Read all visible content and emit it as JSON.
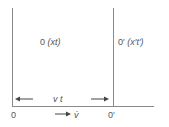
{
  "diagram": {
    "frame_S_label": "0 (xt)",
    "frame_S_origin": "0",
    "frame_S_coords": "(xt)",
    "frame_S_prime_origin": "0′",
    "frame_S_prime_coords": "(x′t′)",
    "distance_label": "v t",
    "velocity_label": "v̇",
    "origin_label": "0",
    "origin_prime_label": "0′",
    "colors": {
      "line": "#8a8a8a",
      "text": "#555555",
      "arrow": "#444444"
    }
  }
}
